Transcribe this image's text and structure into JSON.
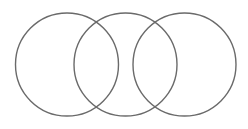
{
  "diagram": {
    "type": "venn",
    "background": "#ffffff",
    "stroke_color": "#6a6a6a",
    "stroke_width": 1.4,
    "circles": [
      {
        "name": "left",
        "cx": 67,
        "cy": 64.5,
        "r": 51.5
      },
      {
        "name": "middle",
        "cx": 125.5,
        "cy": 64.5,
        "r": 51.5
      },
      {
        "name": "right",
        "cx": 184.5,
        "cy": 64.5,
        "r": 51.5
      }
    ]
  }
}
